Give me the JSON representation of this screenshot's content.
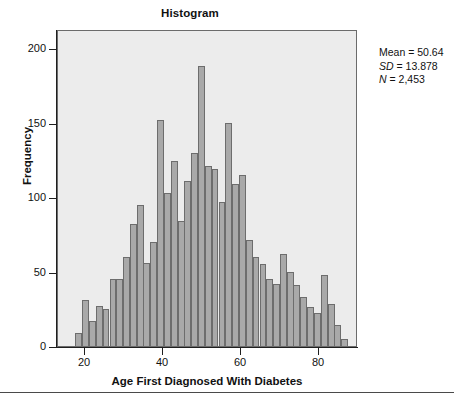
{
  "chart_data": {
    "type": "bar",
    "title": "Histogram",
    "xlabel": "Age First Diagnosed With Diabetes",
    "ylabel": "Frequency",
    "xlim": [
      13,
      90
    ],
    "ylim": [
      0,
      213
    ],
    "xticks": [
      20,
      40,
      60,
      80
    ],
    "yticks": [
      0,
      50,
      100,
      150,
      200
    ],
    "grid": false,
    "bin_width": 1.75,
    "bar_fill": "#a9a9a9",
    "bar_stroke": "#6d6d6d",
    "plot_background": "#ececec",
    "categories": [
      18.3,
      20.1,
      21.8,
      23.6,
      25.3,
      27.1,
      28.8,
      30.6,
      32.3,
      34.1,
      35.8,
      37.6,
      39.3,
      41.1,
      42.8,
      44.6,
      46.3,
      48.1,
      49.8,
      51.6,
      53.3,
      55.1,
      56.8,
      58.6,
      60.3,
      62.1,
      63.8,
      65.6,
      67.3,
      69.1,
      70.8,
      72.6,
      74.3,
      76.1,
      77.8,
      79.6,
      81.3,
      83.1,
      84.8,
      86.6
    ],
    "values": [
      9,
      31,
      17,
      27,
      25,
      45,
      45,
      60,
      82,
      95,
      56,
      70,
      152,
      103,
      124,
      84,
      111,
      130,
      188,
      121,
      119,
      97,
      150,
      109,
      115,
      71,
      60,
      55,
      45,
      42,
      62,
      50,
      41,
      33,
      26,
      22,
      48,
      28,
      14,
      5
    ],
    "annotations": {
      "mean_label": "Mean = 50.64",
      "sd_symbol": "SD",
      "sd_value": " = 13.878",
      "n_symbol": "N",
      "n_value": " = 2,453"
    }
  },
  "footer": {
    "caption": ""
  }
}
